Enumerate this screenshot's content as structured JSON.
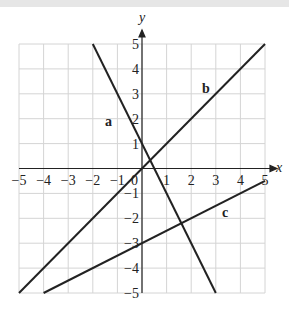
{
  "chart_data": {
    "type": "line",
    "title": "",
    "xlabel": "x",
    "ylabel": "y",
    "xlim": [
      -5,
      5
    ],
    "ylim": [
      -5,
      5
    ],
    "grid": true,
    "x_ticks": [
      "-5",
      "-4",
      "-3",
      "-2",
      "-1",
      "0",
      "1",
      "2",
      "3",
      "4",
      "5"
    ],
    "y_ticks": [
      "-5",
      "-4",
      "-3",
      "-2",
      "-1",
      "1",
      "2",
      "3",
      "4",
      "5"
    ],
    "series": [
      {
        "name": "a",
        "equation": "y = -2x + 1",
        "points": [
          [
            -2,
            5
          ],
          [
            3,
            -5
          ]
        ]
      },
      {
        "name": "b",
        "equation": "y ≈ x + 0.4",
        "points": [
          [
            -5,
            -5
          ],
          [
            5,
            5
          ]
        ]
      },
      {
        "name": "c",
        "equation": "y = 0.5x - 3",
        "points": [
          [
            -4,
            -5
          ],
          [
            5,
            -0.5
          ]
        ]
      }
    ]
  },
  "labels": {
    "x_axis": "x",
    "y_axis": "y",
    "origin": "0",
    "line_a": "a",
    "line_b": "b",
    "line_c": "c"
  }
}
